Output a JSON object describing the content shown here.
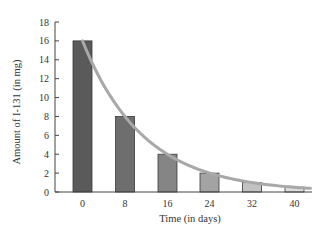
{
  "chart_data": {
    "type": "bar",
    "title": "",
    "xlabel": "Time (in days)",
    "ylabel": "Amount of I-131 (in mg)",
    "categories": [
      "0",
      "8",
      "16",
      "24",
      "32",
      "40"
    ],
    "values": [
      16,
      8,
      4,
      2,
      1,
      0.5
    ],
    "ylim": [
      0,
      18
    ],
    "yticks": [
      0,
      2,
      4,
      6,
      8,
      10,
      12,
      14,
      16,
      18
    ],
    "grid": false,
    "legend": null,
    "overlay": {
      "type": "line",
      "name": "exponential decay curve",
      "description": "Smooth curve through bar tops, y = 16 * (1/2)^(t/8)",
      "x": [
        0,
        4,
        8,
        12,
        16,
        20,
        24,
        28,
        32,
        36,
        40
      ],
      "values": [
        16,
        11.31,
        8,
        5.66,
        4,
        2.83,
        2,
        1.41,
        1,
        0.71,
        0.5
      ]
    },
    "bar_colors": [
      "#5a5a5a",
      "#6e6e6e",
      "#858585",
      "#a3a3a3",
      "#c2c2c2",
      "#dedede"
    ],
    "curve_color": "#a8a8a8"
  }
}
